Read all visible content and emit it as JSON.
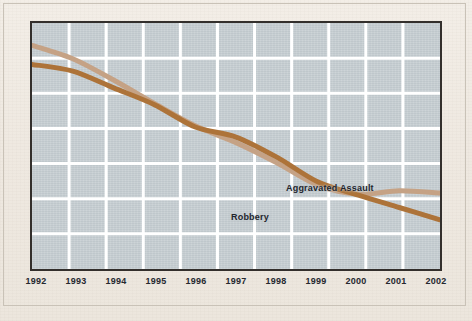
{
  "chart_data": {
    "type": "line",
    "title": "",
    "subtitle": "",
    "xlabel": "",
    "ylabel": "",
    "x": [
      1992,
      1993,
      1994,
      1995,
      1996,
      1997,
      1998,
      1999,
      2000,
      2001,
      2002
    ],
    "tick_labels": [
      "1992",
      "1993",
      "1994",
      "1995",
      "1996",
      "1997",
      "1998",
      "1999",
      "2000",
      "2001",
      "2002"
    ],
    "xlim": [
      1992,
      2002
    ],
    "ylim": [
      0,
      110
    ],
    "grid": true,
    "grid_vertical_lines": 10,
    "grid_horizontal_lines": 6,
    "legend_position": "inline-annotation",
    "annotations": [
      {
        "text": "Aggravated Assault",
        "series": "Aggravated Assault"
      },
      {
        "text": "Robbery",
        "series": "Robbery"
      }
    ],
    "series": [
      {
        "name": "Robbery",
        "color": "#c5a285",
        "values": [
          100.0,
          94.0,
          84.5,
          74.0,
          64.0,
          56.5,
          47.5,
          37.5,
          33.5,
          35.0,
          34.0
        ]
      },
      {
        "name": "Aggravated Assault",
        "color": "#ad7339",
        "values": [
          91.5,
          88.5,
          81.0,
          73.5,
          63.5,
          59.0,
          50.0,
          39.0,
          33.0,
          27.5,
          22.0
        ]
      }
    ]
  },
  "labels": {
    "aggravated_assault": "Aggravated Assault",
    "robbery": "Robbery"
  },
  "colors": {
    "page_background": "#f1ece4",
    "plot_background": "#c4ccd0",
    "frame": "#332f2c",
    "gridline": "#ffffff",
    "robbery_line": "#c5a285",
    "aggravated_assault_line": "#ad7339",
    "tick_text": "#25282f"
  }
}
